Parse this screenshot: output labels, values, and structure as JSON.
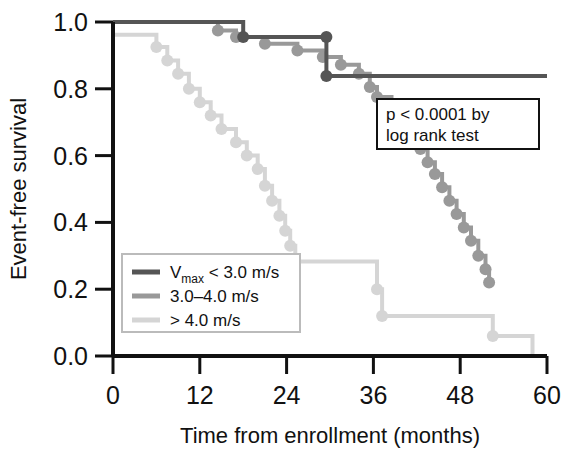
{
  "chart_data": {
    "type": "line",
    "title": "",
    "xlabel": "Time from enrollment (months)",
    "ylabel": "Event-free survival",
    "xlim": [
      0,
      60
    ],
    "ylim": [
      0.0,
      1.0
    ],
    "xticks": [
      "0",
      "12",
      "24",
      "36",
      "48",
      "60"
    ],
    "xtick_values": [
      0,
      12,
      24,
      36,
      48,
      60
    ],
    "yticks": [
      "0.0",
      "0.2",
      "0.4",
      "0.6",
      "0.8",
      "1.0"
    ],
    "ytick_values": [
      0.0,
      0.2,
      0.4,
      0.6,
      0.8,
      1.0
    ],
    "grid": false,
    "legend_position": "lower-left",
    "annotation": {
      "line1": "p < 0.0001 by",
      "line2": "log rank test"
    },
    "series": [
      {
        "name": "Vmax < 3.0 m/s",
        "legend_label": "V",
        "legend_sub": "max",
        "legend_rest": " < 3.0 m/s",
        "color": "#555555",
        "points": [
          [
            0,
            1.0
          ],
          [
            18.0,
            1.0
          ],
          [
            18.0,
            0.955
          ],
          [
            29.5,
            0.955
          ],
          [
            29.5,
            0.838
          ],
          [
            60,
            0.838
          ]
        ],
        "censor_marks": [
          [
            18.0,
            0.955
          ],
          [
            29.5,
            0.955
          ],
          [
            29.5,
            0.838
          ]
        ]
      },
      {
        "name": "3.0-4.0 m/s",
        "legend_label": "3.0–4.0 m/s",
        "color": "#999999",
        "points": [
          [
            0,
            1.0
          ],
          [
            14.5,
            1.0
          ],
          [
            14.5,
            0.975
          ],
          [
            17.0,
            0.975
          ],
          [
            17.0,
            0.955
          ],
          [
            21.0,
            0.955
          ],
          [
            21.0,
            0.935
          ],
          [
            25.5,
            0.935
          ],
          [
            25.5,
            0.915
          ],
          [
            29.0,
            0.915
          ],
          [
            29.0,
            0.895
          ],
          [
            31.5,
            0.895
          ],
          [
            31.5,
            0.872
          ],
          [
            34.0,
            0.872
          ],
          [
            34.0,
            0.845
          ],
          [
            35.5,
            0.845
          ],
          [
            35.5,
            0.805
          ],
          [
            36.5,
            0.805
          ],
          [
            36.5,
            0.775
          ],
          [
            38.5,
            0.775
          ],
          [
            38.5,
            0.735
          ],
          [
            39.5,
            0.735
          ],
          [
            39.5,
            0.7
          ],
          [
            41.5,
            0.7
          ],
          [
            41.5,
            0.66
          ],
          [
            42.5,
            0.66
          ],
          [
            42.5,
            0.62
          ],
          [
            43.5,
            0.62
          ],
          [
            43.5,
            0.58
          ],
          [
            44.5,
            0.58
          ],
          [
            44.5,
            0.545
          ],
          [
            45.5,
            0.545
          ],
          [
            45.5,
            0.505
          ],
          [
            46.5,
            0.505
          ],
          [
            46.5,
            0.465
          ],
          [
            47.5,
            0.465
          ],
          [
            47.5,
            0.425
          ],
          [
            48.5,
            0.425
          ],
          [
            48.5,
            0.385
          ],
          [
            49.5,
            0.385
          ],
          [
            49.5,
            0.345
          ],
          [
            50.5,
            0.345
          ],
          [
            50.5,
            0.3
          ],
          [
            51.5,
            0.3
          ],
          [
            51.5,
            0.26
          ],
          [
            52.0,
            0.26
          ],
          [
            52.0,
            0.22
          ]
        ],
        "censor_marks": [
          [
            14.5,
            0.975
          ],
          [
            17.0,
            0.955
          ],
          [
            21.0,
            0.935
          ],
          [
            25.5,
            0.915
          ],
          [
            29.0,
            0.895
          ],
          [
            31.5,
            0.872
          ],
          [
            34.0,
            0.845
          ],
          [
            35.5,
            0.805
          ],
          [
            36.5,
            0.775
          ],
          [
            38.5,
            0.735
          ],
          [
            39.5,
            0.7
          ],
          [
            41.5,
            0.66
          ],
          [
            42.5,
            0.62
          ],
          [
            43.5,
            0.58
          ],
          [
            44.5,
            0.545
          ],
          [
            45.5,
            0.505
          ],
          [
            46.5,
            0.465
          ],
          [
            47.5,
            0.425
          ],
          [
            48.5,
            0.385
          ],
          [
            49.5,
            0.345
          ],
          [
            50.5,
            0.3
          ],
          [
            51.5,
            0.26
          ],
          [
            52.0,
            0.22
          ]
        ]
      },
      {
        "name": "> 4.0 m/s",
        "legend_label": "> 4.0 m/s",
        "color": "#d5d5d5",
        "points": [
          [
            0,
            0.962
          ],
          [
            6.0,
            0.962
          ],
          [
            6.0,
            0.925
          ],
          [
            7.5,
            0.925
          ],
          [
            7.5,
            0.885
          ],
          [
            9.0,
            0.885
          ],
          [
            9.0,
            0.845
          ],
          [
            10.5,
            0.845
          ],
          [
            10.5,
            0.8
          ],
          [
            12.0,
            0.8
          ],
          [
            12.0,
            0.76
          ],
          [
            13.5,
            0.76
          ],
          [
            13.5,
            0.72
          ],
          [
            15.0,
            0.72
          ],
          [
            15.0,
            0.68
          ],
          [
            17.0,
            0.68
          ],
          [
            17.0,
            0.64
          ],
          [
            18.5,
            0.64
          ],
          [
            18.5,
            0.6
          ],
          [
            20.0,
            0.6
          ],
          [
            20.0,
            0.56
          ],
          [
            21.0,
            0.56
          ],
          [
            21.0,
            0.51
          ],
          [
            22.0,
            0.51
          ],
          [
            22.0,
            0.465
          ],
          [
            23.0,
            0.465
          ],
          [
            23.0,
            0.42
          ],
          [
            23.8,
            0.42
          ],
          [
            23.8,
            0.375
          ],
          [
            24.5,
            0.375
          ],
          [
            24.5,
            0.33
          ],
          [
            25.2,
            0.33
          ],
          [
            25.2,
            0.283
          ],
          [
            36.5,
            0.283
          ],
          [
            36.5,
            0.2
          ],
          [
            37.2,
            0.2
          ],
          [
            37.2,
            0.12
          ],
          [
            52.5,
            0.12
          ],
          [
            52.5,
            0.06
          ],
          [
            58.0,
            0.06
          ],
          [
            58.0,
            0.0
          ]
        ],
        "censor_marks": [
          [
            6.0,
            0.925
          ],
          [
            7.5,
            0.885
          ],
          [
            9.0,
            0.845
          ],
          [
            10.5,
            0.8
          ],
          [
            12.0,
            0.76
          ],
          [
            13.5,
            0.72
          ],
          [
            15.0,
            0.68
          ],
          [
            17.0,
            0.64
          ],
          [
            18.5,
            0.6
          ],
          [
            20.0,
            0.56
          ],
          [
            21.0,
            0.51
          ],
          [
            22.0,
            0.465
          ],
          [
            23.0,
            0.42
          ],
          [
            23.8,
            0.375
          ],
          [
            24.5,
            0.33
          ],
          [
            25.2,
            0.283
          ],
          [
            36.5,
            0.2
          ],
          [
            37.2,
            0.12
          ],
          [
            52.5,
            0.06
          ]
        ]
      }
    ]
  }
}
